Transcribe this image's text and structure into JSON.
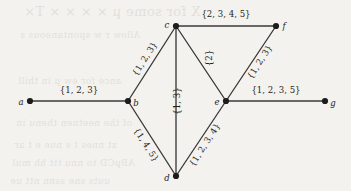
{
  "figure": {
    "type": "undirected-weighted-graph",
    "background_color": "#f3f2ee",
    "ink_color": "#1f1f1d",
    "width": 351,
    "height": 191
  },
  "vertices": [
    {
      "id": "a",
      "label": "a",
      "x": 30,
      "y": 101,
      "label_dx": -9,
      "label_dy": 1
    },
    {
      "id": "b",
      "label": "b",
      "x": 128,
      "y": 101,
      "label_dx": 8,
      "label_dy": 2
    },
    {
      "id": "c",
      "label": "c",
      "x": 176,
      "y": 26,
      "label_dx": -9,
      "label_dy": -1
    },
    {
      "id": "d",
      "label": "d",
      "x": 176,
      "y": 176,
      "label_dx": -9,
      "label_dy": 2
    },
    {
      "id": "e",
      "label": "e",
      "x": 226,
      "y": 101,
      "label_dx": -9,
      "label_dy": 1
    },
    {
      "id": "f",
      "label": "f",
      "x": 276,
      "y": 26,
      "label_dx": 8,
      "label_dy": 0
    },
    {
      "id": "g",
      "label": "g",
      "x": 325,
      "y": 101,
      "label_dx": 8,
      "label_dy": 2
    }
  ],
  "edges": [
    {
      "id": "a-b",
      "from": "a",
      "to": "b",
      "weight": "{1, 2, 3}",
      "label_x": 79,
      "label_y": 90,
      "rotation": 0
    },
    {
      "id": "b-c",
      "from": "b",
      "to": "c",
      "weight": "{1, 2, 3}",
      "label_x": 145,
      "label_y": 59,
      "rotation": -57
    },
    {
      "id": "b-d",
      "from": "b",
      "to": "d",
      "weight": "{1, 4, 5}",
      "label_x": 146,
      "label_y": 145,
      "rotation": 57
    },
    {
      "id": "c-d",
      "from": "c",
      "to": "d",
      "weight": "{1, 3}",
      "label_x": 177,
      "label_y": 101,
      "rotation": -90
    },
    {
      "id": "c-e",
      "from": "c",
      "to": "e",
      "weight": "{2}",
      "label_x": 209,
      "label_y": 58,
      "rotation": -90
    },
    {
      "id": "c-f",
      "from": "c",
      "to": "f",
      "weight": "{2, 3, 4, 5}",
      "label_x": 226,
      "label_y": 14,
      "rotation": 0
    },
    {
      "id": "d-e",
      "from": "d",
      "to": "e",
      "weight": "{1, 2, 3, 4}",
      "label_x": 205,
      "label_y": 145,
      "rotation": -57
    },
    {
      "id": "e-f",
      "from": "e",
      "to": "f",
      "weight": "{1, 2, 3}",
      "label_x": 260,
      "label_y": 62,
      "rotation": -57
    },
    {
      "id": "e-g",
      "from": "e",
      "to": "g",
      "weight": "{1, 2, 3, 5}",
      "label_x": 276,
      "label_y": 90,
      "rotation": 0
    }
  ],
  "background_bleed": [
    {
      "text": "X for some µ × × × × T×",
      "x": 24,
      "y": 4,
      "size": 13
    },
    {
      "text": "Allow r w spontaneous s",
      "x": 20,
      "y": 30,
      "size": 9
    },
    {
      "text": "ance  for  ew   µ in   thill",
      "x": 18,
      "y": 76,
      "size": 9
    },
    {
      "text": "of the  neetnen  thenu   in",
      "x": 16,
      "y": 118,
      "size": 9
    },
    {
      "text": "xt  nnes  t  s  nue  e  t  ar",
      "x": 14,
      "y": 140,
      "size": 9
    },
    {
      "text": "ABµCD   to  nnu  ttt  hh  mul",
      "x": 12,
      "y": 158,
      "size": 9
    },
    {
      "text": "uuts   sne   ssnn   ntt   ue",
      "x": 10,
      "y": 176,
      "size": 9
    }
  ]
}
